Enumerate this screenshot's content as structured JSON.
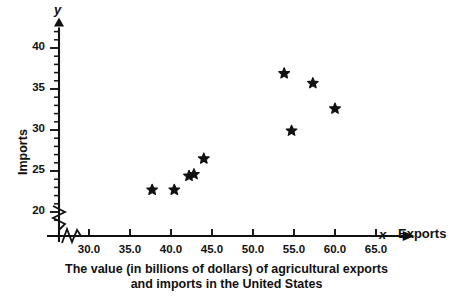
{
  "chart_data": {
    "type": "scatter",
    "title": "The value (in billions of dollars) of agricultural exports and imports in the United States",
    "title_line1": "The value (in billions of dollars) of agricultural exports",
    "title_line2": "and imports in the United States",
    "xlabel": "Exports",
    "ylabel": "Imports",
    "x_axis_symbol": "x",
    "y_axis_symbol": "y",
    "xlim": [
      27.0,
      68.5
    ],
    "ylim": [
      17.8,
      42.5
    ],
    "x_ticks": [
      30.0,
      35.0,
      40.0,
      45.0,
      50.0,
      55.0,
      60.0,
      65.0
    ],
    "x_tick_labels": [
      "30.0",
      "35.0",
      "40.0",
      "45.0",
      "50.0",
      "55.0",
      "60.0",
      "65.0"
    ],
    "y_ticks": [
      20,
      25,
      30,
      35,
      40
    ],
    "y_tick_labels": [
      "20",
      "25",
      "30",
      "35",
      "40"
    ],
    "x_minor_step": 1.0,
    "y_minor_step": 1.0,
    "grid": false,
    "legend": false,
    "axis_break_x": true,
    "axis_break_y": true,
    "marker": "star",
    "marker_color": "#111111",
    "points": [
      {
        "x": 37.7,
        "y": 22.7
      },
      {
        "x": 40.4,
        "y": 22.7
      },
      {
        "x": 42.2,
        "y": 24.4
      },
      {
        "x": 42.8,
        "y": 24.6
      },
      {
        "x": 44.0,
        "y": 26.5
      },
      {
        "x": 53.8,
        "y": 36.9
      },
      {
        "x": 54.7,
        "y": 29.9
      },
      {
        "x": 57.3,
        "y": 35.7
      },
      {
        "x": 60.0,
        "y": 32.6
      }
    ]
  }
}
